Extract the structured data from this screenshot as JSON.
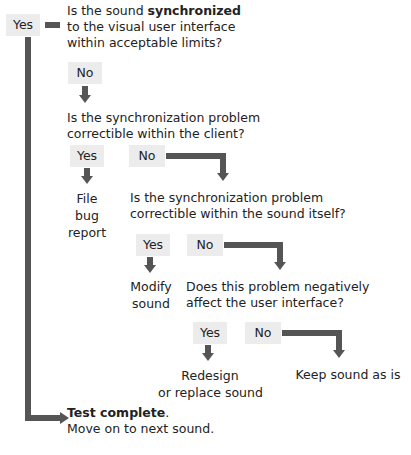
{
  "q1": {
    "line1_pre": "Is the sound ",
    "line1_bold": "synchronized",
    "line2": "to the visual user interface",
    "line3": "within acceptable limits?"
  },
  "q1_yes": "Yes",
  "q1_no": "No",
  "q2": {
    "line1": "Is the synchronization problem",
    "line2": "correctible within the client?"
  },
  "q2_yes": "Yes",
  "q2_no": "No",
  "q2_yes_result": {
    "line1": "File",
    "line2": "bug",
    "line3": "report"
  },
  "q3": {
    "line1": "Is the synchronization problem",
    "line2": "correctible within the sound itself?"
  },
  "q3_yes": "Yes",
  "q3_no": "No",
  "q3_yes_result": {
    "line1": "Modify",
    "line2": "sound"
  },
  "q4": {
    "line1": "Does this problem negatively",
    "line2": "affect the user interface?"
  },
  "q4_yes": "Yes",
  "q4_no": "No",
  "q4_yes_result": {
    "line1": "Redesign",
    "line2": "or replace sound"
  },
  "q4_no_result": "Keep sound as is",
  "end": {
    "bold": "Test complete",
    "suffix": ".",
    "line2": "Move on to next sound."
  },
  "colors": {
    "arrow": "#555555",
    "label_bg": "#ececec",
    "text": "#222222"
  }
}
